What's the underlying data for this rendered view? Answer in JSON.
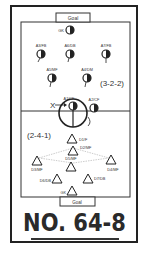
{
  "diagram": {
    "top_goal_label": "Goal",
    "bottom_goal_label": "Goal",
    "attack_formation": "(3-2-2)",
    "defense_formation": "(2-4-1)",
    "drill_number": "NO. 64-8",
    "attackers": [
      {
        "label": "GK",
        "x": 70,
        "y": 30
      },
      {
        "label": "A3/FB",
        "x": 41,
        "y": 54
      },
      {
        "label": "A6/DB",
        "x": 70,
        "y": 54
      },
      {
        "label": "A7/FB",
        "x": 106,
        "y": 54
      },
      {
        "label": "A5/MF",
        "x": 52,
        "y": 78
      },
      {
        "label": "A4/DM",
        "x": 87,
        "y": 78
      },
      {
        "label": "A1/CF",
        "x": 73,
        "y": 105
      },
      {
        "label": "A2/CF",
        "x": 94,
        "y": 107
      }
    ],
    "defenders": [
      {
        "label": "D1/F",
        "x": 72,
        "y": 139
      },
      {
        "label": "D2/MF",
        "x": 73,
        "y": 151
      },
      {
        "label": "D3/MF",
        "x": 37,
        "y": 161
      },
      {
        "label": "D5/MF",
        "x": 71,
        "y": 166
      },
      {
        "label": "D4/MF",
        "x": 111,
        "y": 161
      },
      {
        "label": "D6/DB",
        "x": 57,
        "y": 179
      },
      {
        "label": "D7/DB",
        "x": 88,
        "y": 179
      },
      {
        "label": "GK",
        "x": 72,
        "y": 191
      }
    ],
    "ball_marker": "X"
  }
}
